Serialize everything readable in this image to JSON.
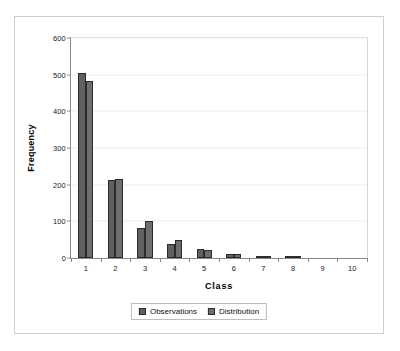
{
  "chart_data": {
    "type": "bar",
    "title": "",
    "xlabel": "Class",
    "ylabel": "Frequency",
    "categories": [
      "1",
      "2",
      "3",
      "4",
      "5",
      "6",
      "7",
      "8",
      "9",
      "10"
    ],
    "series": [
      {
        "name": "Observations",
        "color": "#606060",
        "values": [
          504,
          213,
          82,
          37,
          24,
          12,
          5,
          5,
          0,
          0
        ]
      },
      {
        "name": "Distribution",
        "color": "#6e6e6e",
        "values": [
          482,
          216,
          102,
          48,
          21,
          10,
          5,
          2,
          0,
          0
        ]
      }
    ],
    "ylim": [
      0,
      600
    ],
    "y_ticks": [
      0,
      100,
      200,
      300,
      400,
      500,
      600
    ],
    "y_tick_labels": [
      "0",
      "100",
      "200",
      "300",
      "400",
      "500",
      "600"
    ],
    "grid": true,
    "legend_position": "bottom"
  },
  "legend": {
    "entries": [
      {
        "label": "Observations"
      },
      {
        "label": "Distribution"
      }
    ]
  },
  "axes": {
    "y_title": "Frequency",
    "x_title": "Class"
  },
  "colors": {
    "series_observations": "#606060",
    "series_distribution": "#6e6e6e",
    "axis_line": "#8a8a8a",
    "gridline": "#ededed",
    "frame_border": "#cfcfcf",
    "bar_outline": "#2b2b2b"
  }
}
